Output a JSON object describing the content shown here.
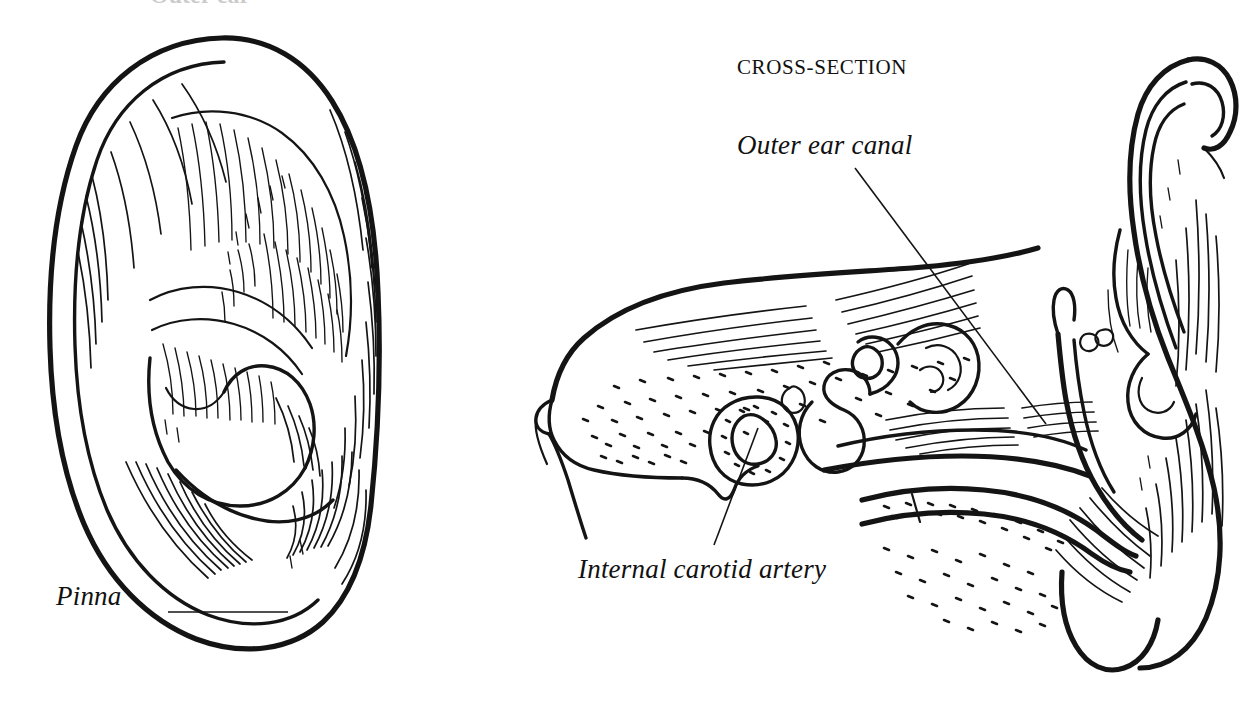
{
  "figure": {
    "domain": "anatomical-line-illustration",
    "background_color": "#ffffff",
    "ink_color": "#141414",
    "style": "pen-and-ink hatched line drawing"
  },
  "labels": {
    "pinna": "Pinna",
    "outer_ear_canal": "Outer ear canal",
    "internal_carotid_artery": "Internal carotid artery",
    "cross_section": "CROSS-SECTION",
    "cut_off_heading": "Outer ear"
  },
  "panels": {
    "left": {
      "name": "pinna-external-view",
      "caption": "Pinna"
    },
    "right": {
      "name": "temporal-bone-cross-section",
      "heading": "CROSS-SECTION",
      "captions": [
        "Outer ear canal",
        "Internal carotid artery"
      ]
    }
  },
  "leaders": [
    {
      "name": "pinna-leader",
      "from": [
        168,
        612
      ],
      "to": [
        288,
        612
      ]
    },
    {
      "name": "canal-leader",
      "from": [
        855,
        168
      ],
      "to": [
        1046,
        424
      ]
    },
    {
      "name": "carotid-leader",
      "from": [
        714,
        545
      ],
      "to": [
        758,
        428
      ]
    }
  ]
}
